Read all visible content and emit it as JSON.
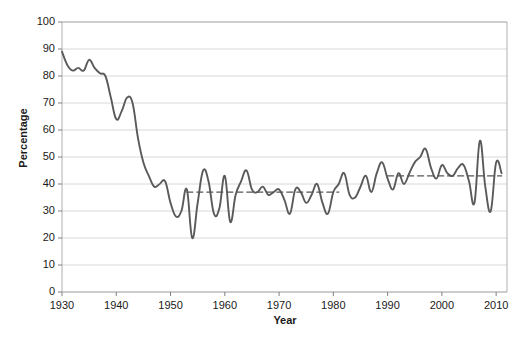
{
  "chart_data": {
    "type": "line",
    "title": "",
    "xlabel": "Year",
    "ylabel": "Percentage",
    "xlim": [
      1930,
      2012
    ],
    "ylim": [
      0,
      100
    ],
    "grid": true,
    "legend": "none",
    "xticks": [
      1930,
      1940,
      1950,
      1960,
      1970,
      1980,
      1990,
      2000,
      2010
    ],
    "yticks": [
      0,
      10,
      20,
      30,
      40,
      50,
      60,
      70,
      80,
      90,
      100
    ],
    "series": [
      {
        "name": "Percentage",
        "color": "#5a5a5a",
        "style": "solid",
        "x": [
          1930,
          1931,
          1932,
          1933,
          1934,
          1935,
          1936,
          1937,
          1938,
          1939,
          1940,
          1941,
          1942,
          1943,
          1944,
          1945,
          1946,
          1947,
          1948,
          1949,
          1950,
          1951,
          1952,
          1953,
          1954,
          1955,
          1956,
          1957,
          1958,
          1959,
          1960,
          1961,
          1962,
          1963,
          1964,
          1965,
          1966,
          1967,
          1968,
          1969,
          1970,
          1971,
          1972,
          1973,
          1974,
          1975,
          1976,
          1977,
          1978,
          1979,
          1980,
          1981,
          1982,
          1983,
          1984,
          1985,
          1986,
          1987,
          1988,
          1989,
          1990,
          1991,
          1992,
          1993,
          1994,
          1995,
          1996,
          1997,
          1998,
          1999,
          2000,
          2001,
          2002,
          2003,
          2004,
          2005,
          2006,
          2007,
          2008,
          2009,
          2010,
          2011
        ],
        "values": [
          89,
          84,
          82,
          83,
          82,
          86,
          83,
          81,
          80,
          72,
          64,
          67,
          72,
          70,
          57,
          48,
          43,
          39,
          40,
          41,
          33,
          28,
          30,
          38,
          20,
          33,
          45,
          41,
          29,
          31,
          43,
          26,
          36,
          41,
          45,
          38,
          37,
          39,
          36,
          37,
          38,
          34,
          29,
          38,
          37,
          33,
          36,
          40,
          33,
          29,
          37,
          40,
          44,
          36,
          35,
          39,
          43,
          37,
          44,
          48,
          42,
          38,
          44,
          40,
          44,
          48,
          50,
          53,
          46,
          42,
          47,
          44,
          43,
          46,
          47,
          41,
          33,
          56,
          39,
          30,
          48,
          44
        ]
      },
      {
        "name": "Trend 1953-1980",
        "color": "#555555",
        "style": "dashed",
        "x": [
          1953,
          1981
        ],
        "values": [
          37,
          37
        ]
      },
      {
        "name": "Trend 1990-2011",
        "color": "#555555",
        "style": "dashed",
        "x": [
          1990,
          2011
        ],
        "values": [
          43,
          43
        ]
      }
    ]
  },
  "axes": {
    "ylabel": "Percentage",
    "xlabel": "Year"
  }
}
